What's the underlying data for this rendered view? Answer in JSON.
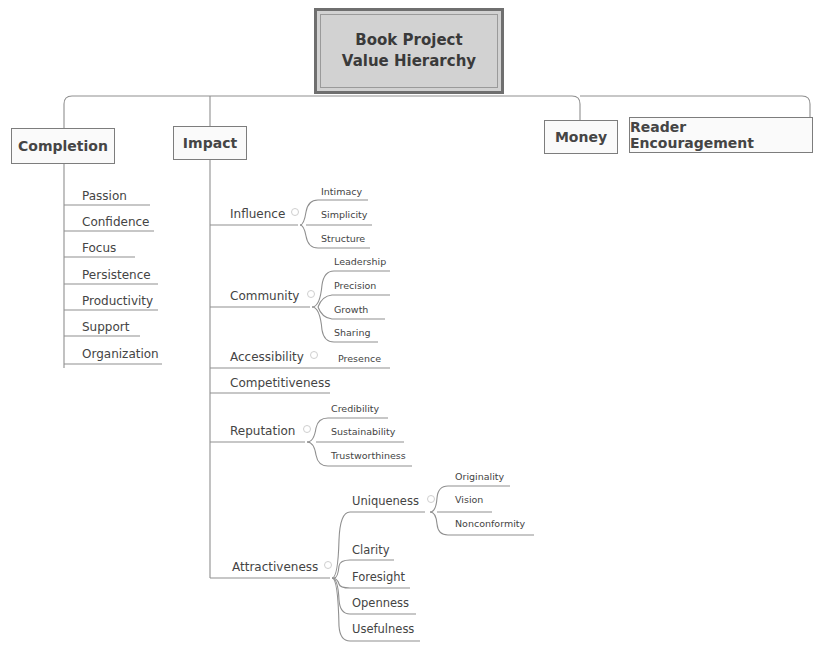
{
  "root": {
    "line1": "Book Project",
    "line2": "Value Hierarchy"
  },
  "main_topics": [
    {
      "id": "completion",
      "label": "Completion"
    },
    {
      "id": "impact",
      "label": "Impact"
    },
    {
      "id": "money",
      "label": "Money"
    },
    {
      "id": "reader",
      "label": "Reader Encouragement"
    }
  ],
  "completion": {
    "children": [
      "Passion",
      "Confidence",
      "Focus",
      "Persistence",
      "Productivity",
      "Support",
      "Organization"
    ]
  },
  "impact": {
    "influence": {
      "label": "Influence",
      "children": [
        "Intimacy",
        "Simplicity",
        "Structure"
      ]
    },
    "community": {
      "label": "Community",
      "children": [
        "Leadership",
        "Precision",
        "Growth",
        "Sharing"
      ]
    },
    "accessibility": {
      "label": "Accessibility",
      "children": [
        "Presence"
      ]
    },
    "competitiveness": {
      "label": "Competitiveness"
    },
    "reputation": {
      "label": "Reputation",
      "children": [
        "Credibility",
        "Sustainability",
        "Trustworthiness"
      ]
    },
    "attractiveness": {
      "label": "Attractiveness",
      "uniqueness": {
        "label": "Uniqueness",
        "children": [
          "Originality",
          "Vision",
          "Nonconformity"
        ]
      },
      "children": [
        "Clarity",
        "Foresight",
        "Openness",
        "Usefulness"
      ]
    }
  },
  "colors": {
    "line": "#8a8a8a",
    "root_fill": "#d2d2d2",
    "root_border": "#6f6f6f",
    "text": "#444444"
  }
}
